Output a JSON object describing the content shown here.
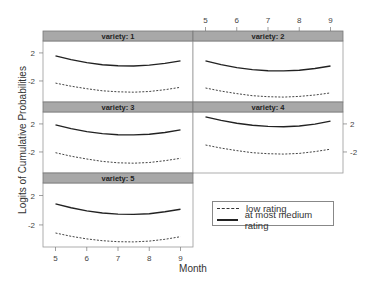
{
  "chart_data": {
    "type": "line",
    "layout": "lattice 2x3 trellis",
    "xlabel": "Month",
    "ylabel": "Logits of Cumulative Probabilities",
    "x_ticks": [
      5,
      6,
      7,
      8,
      9
    ],
    "y_ticks": [
      2,
      -2
    ],
    "xlim": [
      4.6,
      9.4
    ],
    "ylim": [
      -5,
      3.7
    ],
    "grid": false,
    "legend": {
      "position": "bottom-right empty cell",
      "entries": [
        {
          "label": "low rating",
          "style": "dashed"
        },
        {
          "label": "at most medium rating",
          "style": "solid"
        }
      ]
    },
    "x": [
      5,
      5.5,
      6,
      6.5,
      7,
      7.5,
      8,
      8.5,
      9
    ],
    "panels": [
      {
        "title": "variety: 1",
        "series": [
          {
            "name": "at most medium rating",
            "values": [
              1.57,
              1.05,
              0.62,
              0.32,
              0.16,
              0.14,
              0.26,
              0.51,
              0.86
            ]
          },
          {
            "name": "low rating",
            "values": [
              -2.3,
              -2.75,
              -3.1,
              -3.4,
              -3.55,
              -3.6,
              -3.5,
              -3.25,
              -2.9
            ]
          }
        ]
      },
      {
        "title": "variety: 2",
        "series": [
          {
            "name": "at most medium rating",
            "values": [
              0.86,
              0.33,
              -0.09,
              -0.38,
              -0.53,
              -0.57,
              -0.47,
              -0.22,
              0.14
            ]
          },
          {
            "name": "low rating",
            "values": [
              -3.0,
              -3.45,
              -3.8,
              -4.1,
              -4.25,
              -4.3,
              -4.2,
              -4.0,
              -3.7
            ]
          }
        ]
      },
      {
        "title": "variety: 3",
        "series": [
          {
            "name": "at most medium rating",
            "values": [
              1.86,
              1.33,
              0.91,
              0.62,
              0.46,
              0.43,
              0.53,
              0.78,
              1.14
            ]
          },
          {
            "name": "low rating",
            "values": [
              -2.1,
              -2.6,
              -3.0,
              -3.35,
              -3.55,
              -3.6,
              -3.5,
              -3.25,
              -2.9
            ]
          }
        ]
      },
      {
        "title": "variety: 4",
        "series": [
          {
            "name": "at most medium rating",
            "values": [
              3.0,
              2.5,
              2.1,
              1.8,
              1.64,
              1.6,
              1.7,
              1.98,
              2.4
            ]
          },
          {
            "name": "low rating",
            "values": [
              -1.0,
              -1.45,
              -1.8,
              -2.1,
              -2.25,
              -2.3,
              -2.2,
              -1.95,
              -1.6
            ]
          }
        ]
      },
      {
        "title": "variety: 5",
        "series": [
          {
            "name": "at most medium rating",
            "values": [
              0.86,
              0.33,
              -0.09,
              -0.38,
              -0.53,
              -0.57,
              -0.47,
              -0.22,
              0.14
            ]
          },
          {
            "name": "low rating",
            "values": [
              -3.1,
              -3.55,
              -3.9,
              -4.15,
              -4.28,
              -4.3,
              -4.2,
              -3.95,
              -3.6
            ]
          }
        ]
      }
    ]
  }
}
